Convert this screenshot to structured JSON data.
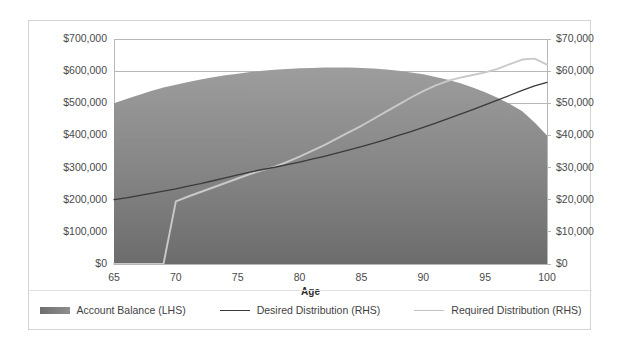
{
  "chart_data": {
    "type": "area",
    "title": "",
    "subtitle": "",
    "xlabel": "Age",
    "ylabel": "",
    "xlim": [
      65,
      100
    ],
    "xticks": [
      65,
      70,
      75,
      80,
      85,
      90,
      95,
      100
    ],
    "xticklabels": [
      "65",
      "70",
      "75",
      "80",
      "85",
      "90",
      "95",
      "100"
    ],
    "y_left": {
      "label": "",
      "lim": [
        0,
        700000
      ],
      "ticks": [
        0,
        100000,
        200000,
        300000,
        400000,
        500000,
        600000,
        700000
      ],
      "ticklabels": [
        "$0",
        "$100,000",
        "$200,000",
        "$300,000",
        "$400,000",
        "$500,000",
        "$600,000",
        "$700,000"
      ]
    },
    "y_right": {
      "label": "",
      "lim": [
        0,
        70000
      ],
      "ticks": [
        0,
        10000,
        20000,
        30000,
        40000,
        50000,
        60000,
        70000
      ],
      "ticklabels": [
        "$0",
        "$10,000",
        "$20,000",
        "$30,000",
        "$40,000",
        "$50,000",
        "$60,000",
        "$70,000"
      ]
    },
    "grid": true,
    "legend_position": "bottom",
    "x": [
      65,
      66,
      67,
      68,
      69,
      70,
      71,
      72,
      73,
      74,
      75,
      76,
      77,
      78,
      79,
      80,
      81,
      82,
      83,
      84,
      85,
      86,
      87,
      88,
      89,
      90,
      91,
      92,
      93,
      94,
      95,
      96,
      97,
      98,
      99,
      100
    ],
    "series": [
      {
        "name": "Account Balance (LHS)",
        "axis": "left",
        "type": "area",
        "color": "#808080",
        "values": [
          500000,
          513000,
          526000,
          538000,
          549000,
          558000,
          566000,
          574000,
          581000,
          587000,
          592000,
          597000,
          601000,
          604000,
          607000,
          609000,
          610000,
          611000,
          611000,
          611000,
          610000,
          608000,
          605000,
          601000,
          596000,
          590000,
          582000,
          573000,
          562000,
          549000,
          534000,
          517000,
          498000,
          475000,
          440000,
          400000
        ]
      },
      {
        "name": "Desired Distribution (RHS)",
        "axis": "right",
        "type": "line",
        "color": "#3a3a3a",
        "values": [
          20000,
          20600,
          21300,
          22000,
          22700,
          23400,
          24200,
          25000,
          25900,
          26800,
          27700,
          28600,
          29400,
          30100,
          30900,
          31700,
          32600,
          33500,
          34500,
          35500,
          36500,
          37600,
          38800,
          40000,
          41200,
          42500,
          43800,
          45200,
          46600,
          48000,
          49500,
          51000,
          52500,
          54000,
          55400,
          56500
        ]
      },
      {
        "name": "Required Distribution (RHS)",
        "axis": "right",
        "type": "line",
        "color": "#c9c9c9",
        "values": [
          0,
          0,
          0,
          0,
          0,
          19500,
          21000,
          22400,
          23800,
          25200,
          26600,
          28000,
          29200,
          30300,
          31800,
          33400,
          35200,
          37000,
          39000,
          41000,
          43000,
          45200,
          47400,
          49600,
          51800,
          53800,
          55600,
          57000,
          58000,
          58800,
          59600,
          60700,
          62200,
          63600,
          63900,
          62000
        ]
      }
    ]
  },
  "legend": {
    "items": [
      {
        "label": "Account Balance (LHS)",
        "marker": "area-swatch"
      },
      {
        "label": "Desired Distribution (RHS)",
        "marker": "line-dark"
      },
      {
        "label": "Required Distribution (RHS)",
        "marker": "line-light"
      }
    ]
  },
  "colors": {
    "area_fill_top": "#9a9a9a",
    "area_fill_bottom": "#6e6e6e",
    "desired_line": "#3a3a3a",
    "required_line": "#c9c9c9",
    "gridline": "#b7b7b7",
    "frame_border": "#d4d4d4",
    "axis_text": "#4a4a4a"
  }
}
